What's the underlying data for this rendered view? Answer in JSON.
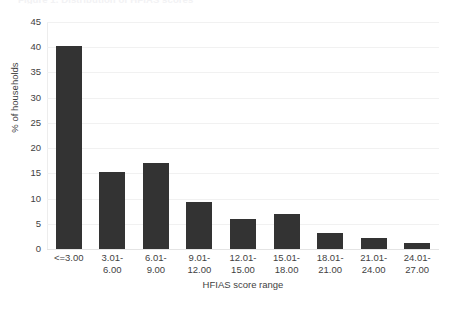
{
  "chart_data": {
    "type": "bar",
    "title": "Figure 1. Distribution of HFIAS scores",
    "xlabel": "HFIAS score range",
    "ylabel": "% of households",
    "categories": [
      "<=3.00",
      "3.01-\n6.00",
      "6.01-\n9.00",
      "9.01-\n12.00",
      "12.01-\n15.00",
      "15.01-\n18.00",
      "18.01-\n21.00",
      "21.01-\n24.00",
      "24.01-\n27.00"
    ],
    "values": [
      40.2,
      15.2,
      17.0,
      9.3,
      6.0,
      7.0,
      3.1,
      2.2,
      1.1
    ],
    "ylim": [
      0,
      45
    ],
    "yticks": [
      0,
      5,
      10,
      15,
      20,
      25,
      30,
      35,
      40,
      45
    ],
    "ytick_labels": [
      "0",
      "5",
      "10",
      "15",
      "20",
      "25",
      "30",
      "35",
      "40",
      "45"
    ],
    "grid": true,
    "legend": false,
    "bar_color": "#333333",
    "grid_color": "#f1f1f1",
    "background_color": "#ffffff"
  }
}
